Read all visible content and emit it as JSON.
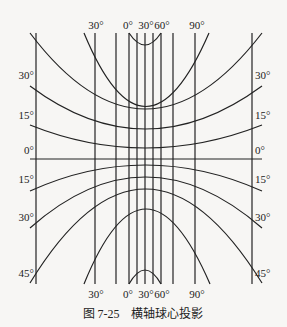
{
  "figure": {
    "caption": "图 7-25　横轴球心投影",
    "line_color": "#222222",
    "background": "#f7f6f4",
    "top_labels": [
      {
        "text": "30°",
        "x": 96
      },
      {
        "text": "0°",
        "x": 128
      },
      {
        "text": "30°",
        "x": 146
      },
      {
        "text": "60°",
        "x": 162
      },
      {
        "text": "90°",
        "x": 197
      }
    ],
    "bottom_labels": [
      {
        "text": "30°",
        "x": 96
      },
      {
        "text": "0°",
        "x": 128
      },
      {
        "text": "30°",
        "x": 146
      },
      {
        "text": "60°",
        "x": 162
      },
      {
        "text": "90°",
        "x": 197
      }
    ],
    "left_labels": [
      {
        "text": "30°",
        "y": 79
      },
      {
        "text": "15°",
        "y": 119
      },
      {
        "text": "0°",
        "y": 154
      },
      {
        "text": "15°",
        "y": 183
      },
      {
        "text": "30°",
        "y": 221
      },
      {
        "text": "45°",
        "y": 277
      }
    ],
    "right_labels": [
      {
        "text": "30°",
        "y": 79
      },
      {
        "text": "15°",
        "y": 119
      },
      {
        "text": "0°",
        "y": 154
      },
      {
        "text": "15°",
        "y": 183
      },
      {
        "text": "30°",
        "y": 221
      },
      {
        "text": "45°",
        "y": 277
      }
    ],
    "meridians_x": [
      36,
      95,
      116,
      129,
      137,
      145,
      153,
      161,
      173,
      195,
      252
    ],
    "meridian_top": 33,
    "meridian_bottom": 284,
    "equator_y": 159,
    "parallels": [
      {
        "d": "M 129 33 Q 145 57 161 33"
      },
      {
        "d": "M 84 33 Q 145 180 209 33"
      },
      {
        "d": "M 30 33 Q 145 185 262 33"
      },
      {
        "d": "M 30 86 Q 145 172 262 86"
      },
      {
        "d": "M 30 125 Q 145 171 262 125"
      },
      {
        "d": "M 30 159 L 262 159"
      },
      {
        "d": "M 30 191 Q 145 139 262 191"
      },
      {
        "d": "M 30 228 Q 145 126 262 228"
      },
      {
        "d": "M 30 283 Q 145 95 262 283"
      },
      {
        "d": "M 84 284 Q 145 134 210 284"
      },
      {
        "d": "M 129 284 Q 145 256 161 284"
      }
    ]
  }
}
